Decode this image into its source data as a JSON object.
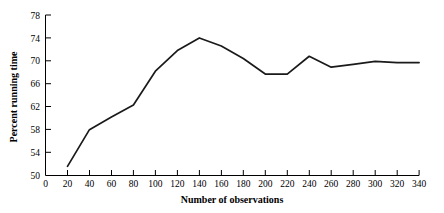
{
  "chart_data": {
    "type": "line",
    "title": "",
    "xlabel": "Number of observations",
    "ylabel": "Percent running time",
    "xlim": [
      0,
      340
    ],
    "ylim": [
      50,
      78
    ],
    "xticks": [
      0,
      20,
      40,
      60,
      80,
      100,
      120,
      140,
      160,
      180,
      200,
      220,
      240,
      260,
      280,
      300,
      320,
      340
    ],
    "yticks": [
      50,
      54,
      58,
      62,
      66,
      70,
      74,
      78
    ],
    "grid": false,
    "legend": null,
    "series": [
      {
        "name": "Percent running time",
        "x": [
          20,
          40,
          60,
          80,
          100,
          120,
          140,
          160,
          180,
          200,
          220,
          240,
          260,
          280,
          300,
          320,
          340
        ],
        "values": [
          51.6,
          58.0,
          60.2,
          62.3,
          68.2,
          71.8,
          74.0,
          72.6,
          70.4,
          67.7,
          67.7,
          70.8,
          68.9,
          69.4,
          69.9,
          69.7,
          69.7
        ]
      }
    ]
  },
  "axes": {
    "y_tick_labels": [
      "78",
      "74",
      "70",
      "66",
      "62",
      "58",
      "54",
      "50"
    ],
    "x_tick_labels": [
      "0",
      "20",
      "40",
      "60",
      "80",
      "100",
      "120",
      "140",
      "160",
      "180",
      "200",
      "220",
      "240",
      "260",
      "280",
      "300",
      "320",
      "340"
    ],
    "y_axis_title": "Percent running time",
    "x_axis_title": "Number of observations"
  }
}
